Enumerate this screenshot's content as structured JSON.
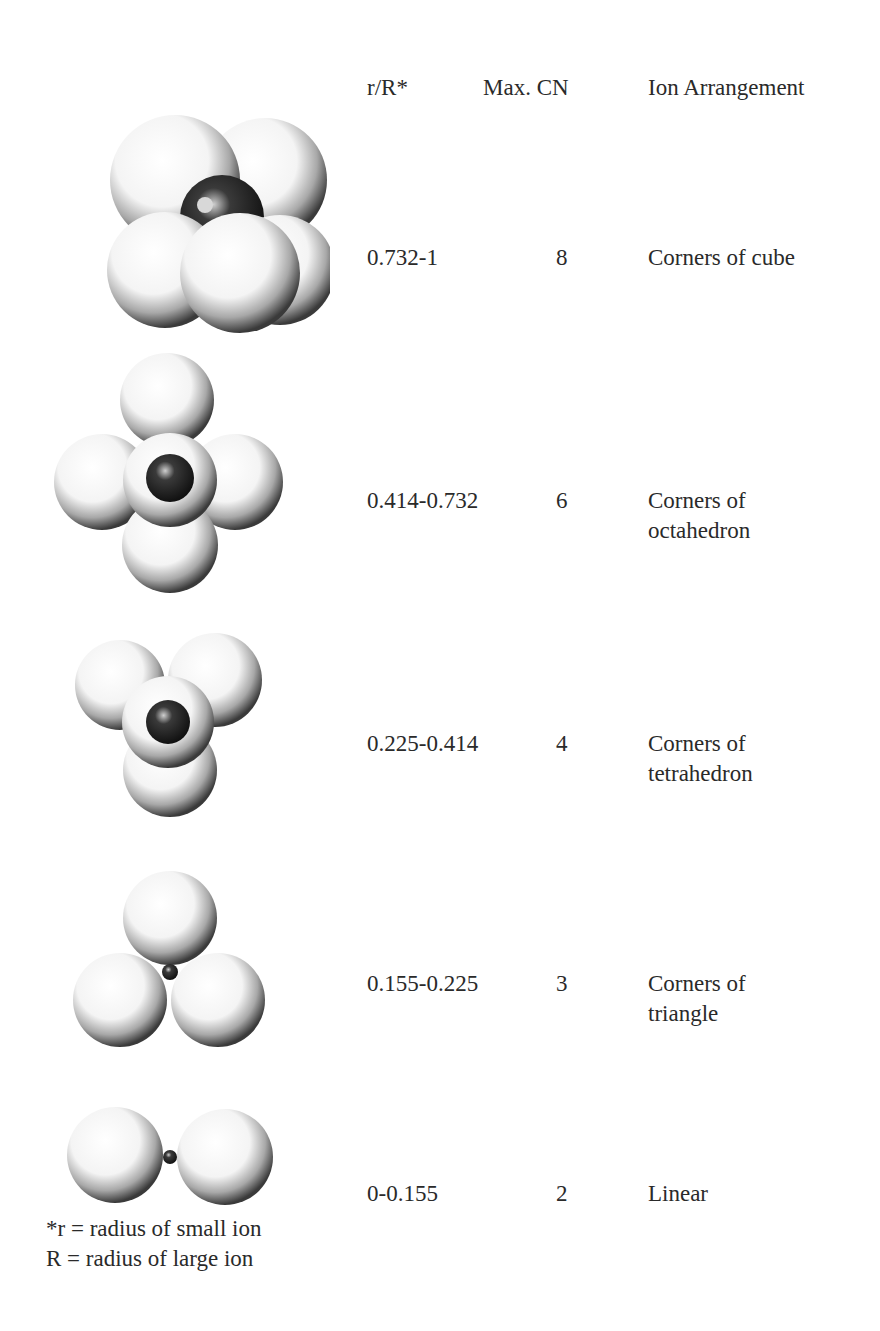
{
  "header": {
    "ratio": "r/R*",
    "cn": "Max. CN",
    "arrangement": "Ion Arrangement"
  },
  "rows": [
    {
      "ratio": "0.732-1",
      "cn": "8",
      "arrangement_line1": "Corners of cube",
      "arrangement_line2": "",
      "figure": "cubic-8-coordination"
    },
    {
      "ratio": "0.414-0.732",
      "cn": "6",
      "arrangement_line1": "Corners of",
      "arrangement_line2": "octahedron",
      "figure": "octahedral-6-coordination"
    },
    {
      "ratio": "0.225-0.414",
      "cn": "4",
      "arrangement_line1": "Corners of",
      "arrangement_line2": "tetrahedron",
      "figure": "tetrahedral-4-coordination"
    },
    {
      "ratio": "0.155-0.225",
      "cn": "3",
      "arrangement_line1": "Corners of",
      "arrangement_line2": "triangle",
      "figure": "triangular-3-coordination"
    },
    {
      "ratio": "0-0.155",
      "cn": "2",
      "arrangement_line1": "Linear",
      "arrangement_line2": "",
      "figure": "linear-2-coordination"
    }
  ],
  "footnote": {
    "line1": "*r  = radius of small ion",
    "line2": "R  = radius of large ion"
  },
  "colors": {
    "sphere_light": "#ffffff",
    "sphere_shadow": "#3a3a3a",
    "small_ion": "#1a1a1a"
  }
}
